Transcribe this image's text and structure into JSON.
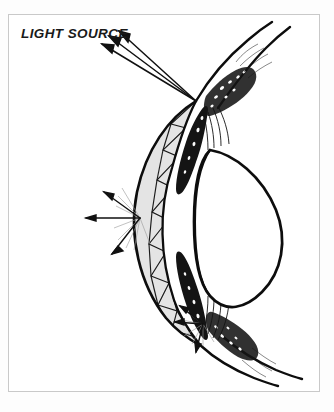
{
  "figure": {
    "domain": "anatomical-diagram",
    "background_color": "#fdfdfd",
    "frame_color": "#c9c9c9",
    "ink_color": "#111111",
    "shade_color": "#e2e2e2"
  },
  "labels": {
    "light_source": "LIGHT SOURCE"
  },
  "annotations": {
    "incident_rays": {
      "name": "incident-light-rays",
      "count": 3,
      "direction": "arrowheads point up-left toward the light source",
      "converge_at": [
        196,
        101
      ]
    },
    "scatter_point_mid": {
      "name": "corneal-scatter-point",
      "origin": [
        140,
        218
      ],
      "ray_count": 8
    },
    "scatter_point_lower": {
      "name": "limbal-scatter-point",
      "origin": [
        203,
        324
      ],
      "ray_count": 6
    }
  },
  "structures": [
    {
      "name": "cornea",
      "description": "hatched crescent with triangular zigzag lamellae"
    },
    {
      "name": "sclera-upper",
      "description": "upper scleral curve sweeping to upper right"
    },
    {
      "name": "sclera-lower",
      "description": "lower scleral curve sweeping to lower right"
    },
    {
      "name": "iris-upper",
      "description": "dark wedge above the lens"
    },
    {
      "name": "iris-lower",
      "description": "dark wedge below the lens"
    },
    {
      "name": "lens",
      "description": "biconvex clear lens body"
    },
    {
      "name": "ciliary-body-upper",
      "description": "stippled ciliary mass upper"
    },
    {
      "name": "ciliary-body-lower",
      "description": "stippled ciliary mass lower"
    },
    {
      "name": "anterior-chamber",
      "description": "clear space between cornea and iris/lens"
    }
  ]
}
